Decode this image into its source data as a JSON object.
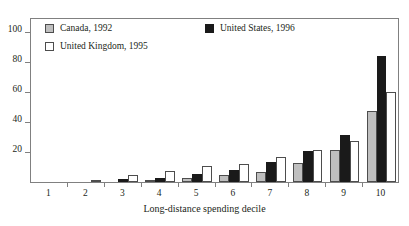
{
  "chart_data": {
    "type": "bar",
    "title": "",
    "subtitle": "",
    "xlabel": "Long-distance spending decile",
    "ylabel": "",
    "categories": [
      "1",
      "2",
      "3",
      "4",
      "5",
      "6",
      "7",
      "8",
      "9",
      "10"
    ],
    "ylim": [
      0,
      110
    ],
    "yticks": [
      20,
      40,
      60,
      80,
      100
    ],
    "grid": false,
    "legend_position": "top-left inside plot",
    "series": [
      {
        "name": "Canada, 1992",
        "color": "#bfbfbf",
        "values": [
          0,
          0,
          0,
          1.5,
          3,
          4.5,
          7,
          12.5,
          21.5,
          47.5
        ]
      },
      {
        "name": "United States, 1996",
        "color": "#1a1a1a",
        "values": [
          0,
          0,
          2,
          3,
          5.5,
          8,
          13.5,
          21,
          31.5,
          84
        ]
      },
      {
        "name": "United Kingdom, 1995",
        "color": "#ffffff",
        "values": [
          0,
          1,
          5,
          7.5,
          11,
          12,
          16.5,
          21.5,
          27.5,
          60
        ]
      }
    ]
  },
  "axis": {
    "y_tick_labels": [
      "20",
      "40",
      "60",
      "80",
      "100"
    ],
    "x_tick_labels": [
      "1",
      "2",
      "3",
      "4",
      "5",
      "6",
      "7",
      "8",
      "9",
      "10"
    ],
    "x_title": "Long-distance spending decile"
  },
  "legend": {
    "entries": [
      {
        "label": "Canada, 1992",
        "swatch": "gray-swatch"
      },
      {
        "label": "United Kingdom, 1995",
        "swatch": "white-swatch"
      },
      {
        "label": "United States, 1996",
        "swatch": "black-swatch"
      }
    ]
  },
  "colors": {
    "canada": "#bfbfbf",
    "united_states": "#1a1a1a",
    "united_kingdom": "#ffffff",
    "frame": "#808080",
    "text": "#231f20"
  }
}
